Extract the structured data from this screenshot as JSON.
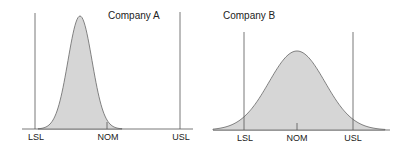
{
  "chart_data": [
    {
      "type": "area",
      "title": "Company A",
      "description": "Narrow normal distribution shifted left of nominal, well within spec limits",
      "x_labels": [
        "LSL",
        "NOM",
        "USL"
      ],
      "distribution": {
        "mean_position": "left of NOM",
        "spread": "narrow"
      },
      "grid": false
    },
    {
      "type": "area",
      "title": "Company B",
      "description": "Wide normal distribution centered on nominal, tails extend beyond spec limits",
      "x_labels": [
        "LSL",
        "NOM",
        "USL"
      ],
      "distribution": {
        "mean_position": "at NOM",
        "spread": "wide"
      },
      "grid": false
    }
  ],
  "colors": {
    "fill": "#d6d6d6",
    "line": "#555555"
  }
}
